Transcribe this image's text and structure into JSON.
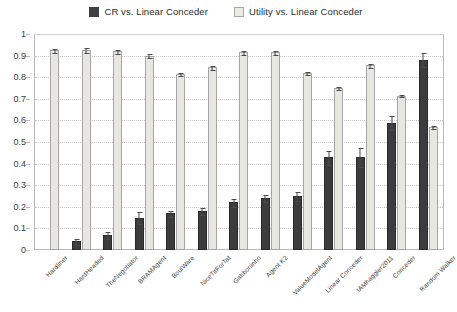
{
  "legend": {
    "position": "top-center",
    "entries": [
      {
        "label": "CR vs. Linear Conceder",
        "swatch": "filled-dark-square",
        "color": "#3c3c3c"
      },
      {
        "label": "Utility vs. Linear Conceder",
        "swatch": "outlined-light-square",
        "color": "#e8e6e0"
      }
    ]
  },
  "chart_data": {
    "type": "bar",
    "title": "",
    "xlabel": "",
    "ylabel": "",
    "ylim": [
      0,
      1
    ],
    "yticks": [
      "0",
      "0.1",
      "0.2",
      "0.3",
      "0.4",
      "0.5",
      "0.6",
      "0.7",
      "0.8",
      "0.9",
      "1"
    ],
    "grid": true,
    "legend_position": "top-center",
    "error_bars": true,
    "categories": [
      "Hardliner",
      "HardHeaded",
      "TheNegotiator",
      "BRAMAgent",
      "BoulWare",
      "NiceTitForTat",
      "Gahboninho",
      "Agent K2",
      "ValueModelAgent",
      "Linear Conceder",
      "IAMhaggler2011",
      "Conceder",
      "Random Walker"
    ],
    "series": [
      {
        "name": "CR vs. Linear Conceder",
        "color": "#3c3c3c",
        "values": [
          0.0,
          0.04,
          0.07,
          0.15,
          0.17,
          0.18,
          0.22,
          0.24,
          0.25,
          0.43,
          0.43,
          0.59,
          0.88
        ],
        "errors": [
          0.0,
          0.015,
          0.02,
          0.03,
          0.015,
          0.02,
          0.02,
          0.02,
          0.025,
          0.035,
          0.045,
          0.035,
          0.035
        ]
      },
      {
        "name": "Utility vs. Linear Conceder",
        "color": "#e8e6e0",
        "values": [
          0.925,
          0.925,
          0.92,
          0.9,
          0.815,
          0.845,
          0.915,
          0.915,
          0.82,
          0.75,
          0.855,
          0.715,
          0.57
        ],
        "errors": [
          0.012,
          0.015,
          0.012,
          0.01,
          0.008,
          0.01,
          0.01,
          0.01,
          0.01,
          0.01,
          0.012,
          0.008,
          0.01
        ]
      }
    ]
  }
}
